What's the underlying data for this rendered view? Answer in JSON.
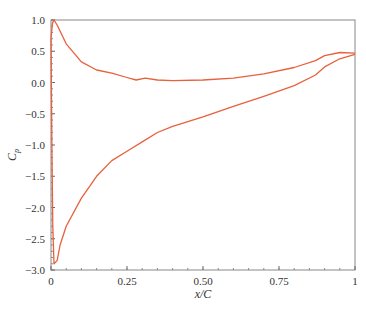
{
  "chart_data": {
    "type": "line",
    "title": "",
    "xlabel": "x/C",
    "ylabel": "Cp",
    "xlim": [
      0,
      1
    ],
    "ylim": [
      -3.0,
      1.0
    ],
    "grid": false,
    "legend": null,
    "x_ticks": [
      "0",
      "0.25",
      "0.50",
      "0.75",
      "1"
    ],
    "x_tick_values": [
      0,
      0.25,
      0.5,
      0.75,
      1.0
    ],
    "y_ticks": [
      "1.0",
      "0.5",
      "0.0",
      "-0.5",
      "-1.0",
      "-1.5",
      "-2.0",
      "-2.5",
      "-3.0"
    ],
    "y_tick_values": [
      1.0,
      0.5,
      0.0,
      -0.5,
      -1.0,
      -1.5,
      -2.0,
      -2.5,
      -3.0
    ],
    "line_color": "#e8603c",
    "series": [
      {
        "name": "upper surface",
        "x": [
          0.0,
          0.005,
          0.01,
          0.02,
          0.05,
          0.1,
          0.15,
          0.2,
          0.25,
          0.28,
          0.31,
          0.35,
          0.4,
          0.5,
          0.6,
          0.7,
          0.8,
          0.87,
          0.9,
          0.95,
          1.0
        ],
        "y": [
          0.7,
          0.95,
          1.0,
          0.92,
          0.62,
          0.33,
          0.2,
          0.15,
          0.08,
          0.04,
          0.07,
          0.04,
          0.03,
          0.04,
          0.07,
          0.14,
          0.24,
          0.35,
          0.43,
          0.48,
          0.47
        ]
      },
      {
        "name": "lower surface",
        "x": [
          0.0,
          0.003,
          0.006,
          0.01,
          0.02,
          0.03,
          0.05,
          0.1,
          0.15,
          0.2,
          0.25,
          0.3,
          0.35,
          0.4,
          0.5,
          0.6,
          0.7,
          0.8,
          0.87,
          0.9,
          0.95,
          1.0
        ],
        "y": [
          0.7,
          -1.0,
          -2.3,
          -2.9,
          -2.85,
          -2.6,
          -2.3,
          -1.85,
          -1.5,
          -1.25,
          -1.1,
          -0.95,
          -0.8,
          -0.7,
          -0.55,
          -0.38,
          -0.22,
          -0.05,
          0.12,
          0.25,
          0.38,
          0.45
        ]
      }
    ]
  }
}
